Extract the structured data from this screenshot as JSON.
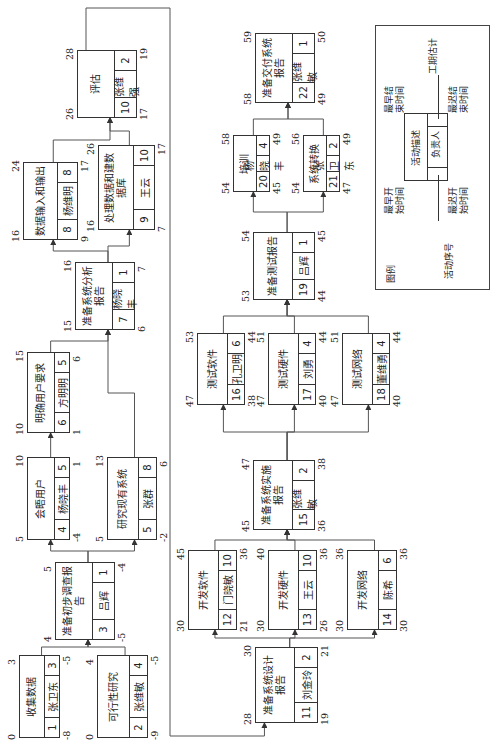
{
  "diagram": {
    "orientation": "rotated -90deg",
    "nodes": [
      {
        "id": "1",
        "desc": "收集数据",
        "owner": "张卫东",
        "duration": "3",
        "es": "0",
        "ef": "3",
        "ls": "-8",
        "lf": "-5",
        "box": [
          10,
          19,
          83,
          41
        ]
      },
      {
        "id": "2",
        "desc": "可行性研究",
        "owner": "张维敏",
        "duration": "4",
        "es": "0",
        "ef": "4",
        "ls": "-9",
        "lf": "-5",
        "box": [
          10,
          97,
          83,
          51
        ]
      },
      {
        "id": "3",
        "desc": "准备初步调查报告",
        "owner": "吕辉",
        "duration": "1",
        "es": "4",
        "ef": "5",
        "ls": "-5",
        "lf": "-4",
        "box": [
          108,
          55,
          78,
          60
        ]
      },
      {
        "id": "4",
        "desc": "会晤用户",
        "owner": "杨晓丰",
        "duration": "5",
        "es": "5",
        "ef": "10",
        "ls": "-4",
        "lf": "1",
        "box": [
          208,
          27,
          83,
          43
        ]
      },
      {
        "id": "5",
        "desc": "研究现有系统",
        "owner": "张群",
        "duration": "8",
        "es": "5",
        "ef": "13",
        "ls": "-2",
        "lf": "6",
        "box": [
          208,
          107,
          83,
          50
        ]
      },
      {
        "id": "6",
        "desc": "明确用户要求",
        "owner": "方明明",
        "duration": "5",
        "es": "10",
        "ef": "15",
        "ls": "1",
        "lf": "6",
        "box": [
          315,
          27,
          81,
          43
        ]
      },
      {
        "id": "7",
        "desc": "准备系统分析报告",
        "owner": "杨晓丰",
        "duration": "1",
        "es": "15",
        "ef": "16",
        "ls": "6",
        "lf": "7",
        "box": [
          418,
          75,
          68,
          60
        ]
      },
      {
        "id": "8",
        "desc": "数据输入和输出",
        "owner": "杨维明",
        "duration": "8",
        "es": "16",
        "ef": "24",
        "ls": "9",
        "lf": "17",
        "box": [
          508,
          23,
          78,
          55
        ]
      },
      {
        "id": "9",
        "desc": "处理数据和建数据库",
        "owner": "王云",
        "duration": "10",
        "es": "16",
        "ef": "26",
        "ls": "7",
        "lf": "17",
        "box": [
          518,
          98,
          85,
          57
        ]
      },
      {
        "id": "10",
        "desc": "评估",
        "owner": "张维强",
        "duration": "2",
        "es": "26",
        "ef": "28",
        "ls": "17",
        "lf": "19",
        "box": [
          630,
          77,
          68,
          60
        ]
      },
      {
        "id": "11",
        "desc": "准备系统设计报告",
        "owner": "刘金玲",
        "duration": "2",
        "es": "28",
        "ef": "30",
        "ls": "19",
        "lf": "21",
        "box": [
          25,
          255,
          76,
          63
        ]
      },
      {
        "id": "12",
        "desc": "开发软件",
        "owner": "门晓敏",
        "duration": "10",
        "es": "30",
        "ef": "45",
        "ls": "21",
        "lf": "36",
        "box": [
          118,
          188,
          80,
          49
        ]
      },
      {
        "id": "13",
        "desc": "开发硬件",
        "owner": "王云",
        "duration": "10",
        "es": "30",
        "ef": "40",
        "ls": "26",
        "lf": "36",
        "box": [
          118,
          268,
          80,
          49
        ]
      },
      {
        "id": "14",
        "desc": "开发网络",
        "owner": "陈希",
        "duration": "6",
        "es": "30",
        "ef": "36",
        "ls": "30",
        "lf": "36",
        "box": [
          118,
          347,
          80,
          50
        ]
      },
      {
        "id": "15",
        "desc": "准备系统实施报告",
        "owner": "张维敏",
        "duration": "2",
        "es": "45",
        "ef": "47",
        "ls": "36",
        "lf": "38",
        "box": [
          218,
          253,
          70,
          62
        ]
      },
      {
        "id": "16",
        "desc": "测试软件",
        "owner": "孔卫明",
        "duration": "6",
        "es": "47",
        "ef": "53",
        "ls": "38",
        "lf": "44",
        "box": [
          343,
          197,
          72,
          48
        ]
      },
      {
        "id": "17",
        "desc": "测试硬件",
        "owner": "刘勇",
        "duration": "4",
        "es": "47",
        "ef": "51",
        "ls": "40",
        "lf": "44",
        "box": [
          343,
          268,
          72,
          48
        ]
      },
      {
        "id": "18",
        "desc": "测试网络",
        "owner": "董维勇",
        "duration": "4",
        "es": "47",
        "ef": "51",
        "ls": "40",
        "lf": "44",
        "box": [
          343,
          342,
          72,
          48
        ]
      },
      {
        "id": "19",
        "desc": "准备测试报告",
        "owner": "吕辉",
        "duration": "1",
        "es": "53",
        "ef": "54",
        "ls": "44",
        "lf": "45",
        "box": [
          448,
          253,
          68,
          62
        ]
      },
      {
        "id": "20",
        "desc": "培训",
        "owner": "杨晓丰",
        "duration": "4",
        "es": "54",
        "ef": "58",
        "ls": "45",
        "lf": "49",
        "box": [
          556,
          233,
          57,
          37
        ]
      },
      {
        "id": "21",
        "desc": "系统转换",
        "owner": "张卫东",
        "duration": "2",
        "es": "54",
        "ef": "56",
        "ls": "47",
        "lf": "49",
        "box": [
          556,
          303,
          57,
          37
        ]
      },
      {
        "id": "22",
        "desc": "准备交付系统报告",
        "owner": "张维敏",
        "duration": "1",
        "es": "58",
        "ef": "59",
        "ls": "49",
        "lf": "50",
        "box": [
          645,
          255,
          70,
          60
        ]
      }
    ],
    "edges": [
      [
        "1",
        "3"
      ],
      [
        "2",
        "3"
      ],
      [
        "3",
        "4"
      ],
      [
        "3",
        "5"
      ],
      [
        "4",
        "6"
      ],
      [
        "6",
        "7"
      ],
      [
        "5",
        "7"
      ],
      [
        "7",
        "8"
      ],
      [
        "7",
        "9"
      ],
      [
        "8",
        "10"
      ],
      [
        "9",
        "10"
      ],
      [
        "10",
        "11"
      ],
      [
        "11",
        "12"
      ],
      [
        "11",
        "13"
      ],
      [
        "11",
        "14"
      ],
      [
        "12",
        "15"
      ],
      [
        "13",
        "15"
      ],
      [
        "14",
        "15"
      ],
      [
        "15",
        "16"
      ],
      [
        "15",
        "17"
      ],
      [
        "15",
        "18"
      ],
      [
        "16",
        "19"
      ],
      [
        "17",
        "19"
      ],
      [
        "18",
        "19"
      ],
      [
        "19",
        "20"
      ],
      [
        "19",
        "21"
      ],
      [
        "20",
        "22"
      ],
      [
        "21",
        "22"
      ]
    ],
    "legend": {
      "title": "图例",
      "activity_no": "活动序号",
      "earliest_start": "最早开始时间",
      "earliest_finish": "最早结束时间",
      "latest_start": "最迟开始时间",
      "latest_finish": "最迟结束时间",
      "description": "活动描述",
      "owner": "负责人",
      "duration": "工期估计"
    }
  }
}
